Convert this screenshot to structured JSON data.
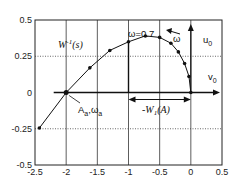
{
  "chart_data": {
    "type": "line",
    "title": "",
    "xlabel": "",
    "ylabel": "",
    "xlim": [
      -2.5,
      0.5
    ],
    "ylim": [
      -0.5,
      0.5
    ],
    "grid": true,
    "legend": "none",
    "x_ticks": [
      "-2.5",
      "-2",
      "-1.5",
      "-1",
      "-0.5",
      "0",
      "0.5"
    ],
    "y_ticks": [
      "0.5",
      "0.25",
      "0",
      "-0.25",
      "-0.5"
    ],
    "series": [
      {
        "name": "W^-1(s)",
        "x": [
          -2.43,
          -2.0,
          -1.62,
          -1.3,
          -1.0,
          -0.73,
          -0.5,
          -0.32,
          -0.2,
          -0.1,
          -0.03,
          0.0
        ],
        "y": [
          -0.245,
          0.0,
          0.17,
          0.29,
          0.35,
          0.39,
          0.38,
          0.34,
          0.28,
          0.2,
          0.11,
          0.0
        ]
      }
    ],
    "annotations": {
      "curve_label": "W",
      "curve_label_sup": "-1",
      "curve_label_arg": "(s)",
      "omega_value": "ω=0.7",
      "omega_arrow": "ω",
      "u_axis": "u",
      "u_sub": "0",
      "v_axis": "v",
      "v_sub": "0",
      "intersection": "A",
      "intersection_sub1": "a",
      "intersection_sep": ",ω",
      "intersection_sub2": "a",
      "dim_label": "-W",
      "dim_sub": "1",
      "dim_arg": "(A)"
    }
  }
}
